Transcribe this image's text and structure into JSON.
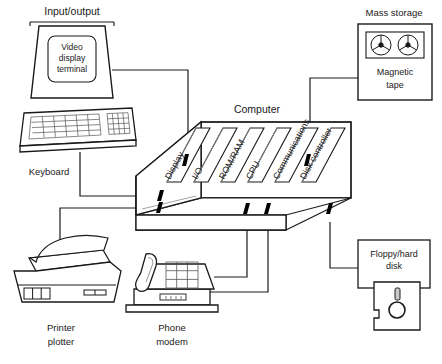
{
  "diagram": {
    "group_labels": {
      "input_output": "Input/output",
      "mass_storage": "Mass storage",
      "computer": "Computer"
    },
    "devices": [
      {
        "id": "video-display-terminal",
        "name": "Video display terminal",
        "line1": "Video",
        "line2": "display",
        "line3": "terminal"
      },
      {
        "id": "keyboard",
        "name": "Keyboard",
        "line1": "Keyboard"
      },
      {
        "id": "printer-plotter",
        "name": "Printer plotter",
        "line1": "Printer",
        "line2": "plotter"
      },
      {
        "id": "phone-modem",
        "name": "Phone modem",
        "line1": "Phone",
        "line2": "modem"
      },
      {
        "id": "magnetic-tape",
        "name": "Magnetic tape",
        "line1": "Magnetic",
        "line2": "tape"
      },
      {
        "id": "floppy-hard-disk",
        "name": "Floppy/hard disk",
        "line1": "Floppy/hard",
        "line2": "disk"
      }
    ],
    "cards": [
      {
        "id": "display",
        "label": "Display"
      },
      {
        "id": "io",
        "label": "I/O"
      },
      {
        "id": "rom-ram",
        "label": "ROM/RAM"
      },
      {
        "id": "cpu",
        "label": "CPU"
      },
      {
        "id": "communications",
        "label": "Communications"
      },
      {
        "id": "disk-controller",
        "label": "Disk controller"
      }
    ],
    "colors": {
      "ink": "#000000",
      "line": "#1a1a1a",
      "inner_line": "#8c8c8c",
      "background": "#ffffff"
    }
  }
}
